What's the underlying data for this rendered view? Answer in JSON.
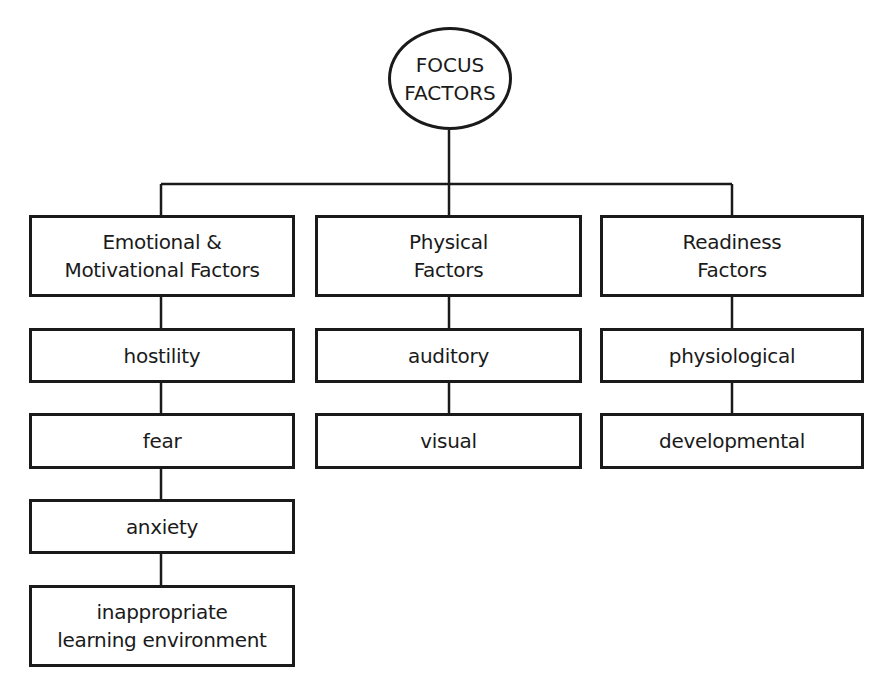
{
  "root": {
    "label": "FOCUS\nFACTORS"
  },
  "branches": [
    {
      "label": "Emotional &\nMotivational Factors",
      "children": [
        "hostility",
        "fear",
        "anxiety",
        "inappropriate\nlearning environment"
      ]
    },
    {
      "label": "Physical\nFactors",
      "children": [
        "auditory",
        "visual"
      ]
    },
    {
      "label": "Readiness\nFactors",
      "children": [
        "physiological",
        "developmental"
      ]
    }
  ]
}
